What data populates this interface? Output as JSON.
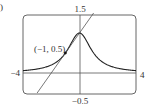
{
  "figure_marker": ")",
  "chart_data": {
    "type": "line",
    "title": "",
    "xlabel": "",
    "ylabel": "",
    "xlim": [
      -4,
      4
    ],
    "ylim": [
      -0.5,
      1.5
    ],
    "grid": false,
    "tick_labels": {
      "x_min": "−4",
      "x_max": "4",
      "y_min": "−0.5",
      "y_max": "1.5"
    },
    "series": [
      {
        "name": "curve y = 1/(1+x^2)",
        "x": [
          -4,
          -3,
          -2,
          -1.5,
          -1,
          -0.5,
          0,
          0.5,
          1,
          1.5,
          2,
          3,
          4
        ],
        "y": [
          0.059,
          0.1,
          0.2,
          0.308,
          0.5,
          0.8,
          1.0,
          0.8,
          0.5,
          0.308,
          0.2,
          0.1,
          0.059
        ]
      },
      {
        "name": "tangent line y = 0.5x + 1",
        "x": [
          -3,
          1
        ],
        "y": [
          -0.5,
          1.5
        ]
      }
    ],
    "annotations": [
      {
        "text": "(−1, 0.5)",
        "x": -1,
        "y": 0.5,
        "marker": "point"
      }
    ]
  },
  "colors": {
    "curve": "#222222",
    "tangent": "#555555",
    "axes": "#555555",
    "frame": "#666666",
    "text": "#333333"
  }
}
